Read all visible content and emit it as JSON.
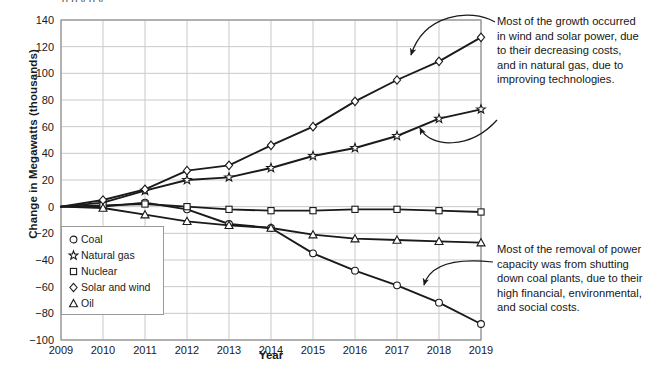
{
  "cut_off_header": "      g      p  y      g    y",
  "chart_data": {
    "type": "line",
    "title": "",
    "xlabel": "Year",
    "ylabel": "Change in Megawatts (thousands)",
    "categories": [
      2009,
      2010,
      2011,
      2012,
      2013,
      2014,
      2015,
      2016,
      2017,
      2018,
      2019
    ],
    "xtick_labels": [
      "2009",
      "2010",
      "2011",
      "2012",
      "2013",
      "2014",
      "2015",
      "2016",
      "2017",
      "2018",
      "2019"
    ],
    "ytick_labels": [
      "140",
      "120",
      "100",
      "80",
      "60",
      "40",
      "20",
      "0",
      "-20",
      "-40",
      "-60",
      "-80",
      "-100"
    ],
    "ylim": [
      -100,
      140
    ],
    "xlim": [
      2009,
      2019
    ],
    "ytick_step": 20,
    "grid": true,
    "legend_position": "inside-bottom-left",
    "series": [
      {
        "name": "Coal",
        "marker": "circle",
        "values": [
          0,
          0,
          3,
          -2,
          -13,
          -16,
          -35,
          -48,
          -59,
          -72,
          -88
        ]
      },
      {
        "name": "Natural gas",
        "marker": "star",
        "values": [
          0,
          3,
          12,
          20,
          22,
          29,
          38,
          44,
          53,
          66,
          73
        ]
      },
      {
        "name": "Nuclear",
        "marker": "square",
        "values": [
          0,
          1,
          2,
          0,
          -2,
          -3,
          -3,
          -2,
          -2,
          -3,
          -4
        ]
      },
      {
        "name": "Solar and wind",
        "marker": "diamond",
        "values": [
          0,
          5,
          13,
          27,
          31,
          46,
          60,
          79,
          95,
          109,
          127
        ]
      },
      {
        "name": "Oil",
        "marker": "triangle",
        "values": [
          0,
          -1,
          -6,
          -11,
          -14,
          -16,
          -21,
          -24,
          -25,
          -26,
          -27
        ]
      }
    ],
    "annotations": [
      {
        "id": "growth-note",
        "text": "Most of the growth occurred in wind and solar power, due to their decreasing costs, and in natural gas, due to improving technologies.",
        "points_to": [
          "Solar and wind",
          "Natural gas"
        ]
      },
      {
        "id": "removal-note",
        "text": "Most of the removal of power capacity was from shutting down coal plants, due to their high financial, environmental, and social costs.",
        "points_to": [
          "Coal"
        ]
      }
    ],
    "colors": {
      "line": "#1a1a1a",
      "grid": "#c9c9c9",
      "axis": "#8f8f8f",
      "marker_fill": "#ffffff",
      "background": "#ffffff"
    }
  }
}
